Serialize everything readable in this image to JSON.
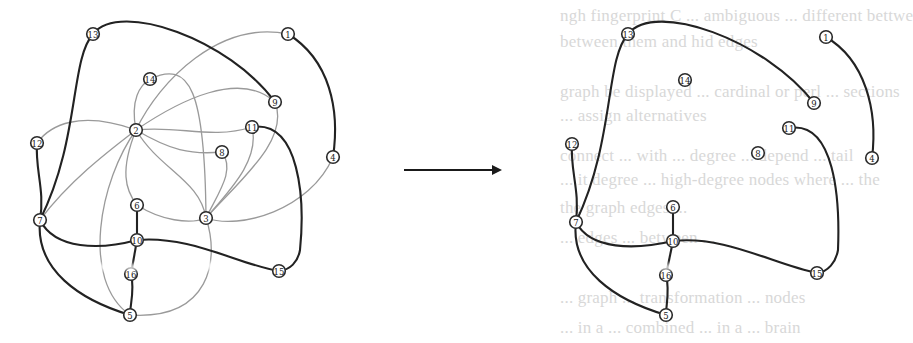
{
  "figure": {
    "arrow": {
      "from": [
        404,
        170
      ],
      "to": [
        500,
        170
      ]
    },
    "colors": {
      "thin_edge": "#9a9a9a",
      "thick_edge": "#222222",
      "node_stroke": "#2a2a2a",
      "background": "#ffffff"
    },
    "background_bleed_text": [
      {
        "text": "ngh fingerprint C ... ambiguous ... different  bettwe",
        "x": 560,
        "y": 18
      },
      {
        "text": "between them and hid edges",
        "x": 560,
        "y": 44
      },
      {
        "text": "graph be displayed ... cardinal or perl ... sections",
        "x": 560,
        "y": 94
      },
      {
        "text": "... assign alternatives",
        "x": 560,
        "y": 118
      },
      {
        "text": "connect ... with ... degree ... depend ... tail",
        "x": 560,
        "y": 158
      },
      {
        "text": "... it degree ... high-degree nodes where ... the",
        "x": 560,
        "y": 182
      },
      {
        "text": "the graph edges ...",
        "x": 560,
        "y": 210
      },
      {
        "text": "... edges ... between ...",
        "x": 560,
        "y": 240
      },
      {
        "text": "... graph ... transformation ... nodes",
        "x": 560,
        "y": 300
      },
      {
        "text": "... in a ... combined ... in a ... brain",
        "x": 560,
        "y": 330
      }
    ]
  },
  "left_graph": {
    "nodes": [
      {
        "id": "13",
        "x": 93,
        "y": 34
      },
      {
        "id": "1",
        "x": 288,
        "y": 34
      },
      {
        "id": "14",
        "x": 150,
        "y": 79
      },
      {
        "id": "9",
        "x": 275,
        "y": 102
      },
      {
        "id": "2",
        "x": 136,
        "y": 130
      },
      {
        "id": "11",
        "x": 252,
        "y": 127
      },
      {
        "id": "12",
        "x": 37,
        "y": 143
      },
      {
        "id": "8",
        "x": 222,
        "y": 152
      },
      {
        "id": "4",
        "x": 333,
        "y": 157
      },
      {
        "id": "6",
        "x": 137,
        "y": 205
      },
      {
        "id": "7",
        "x": 40,
        "y": 220
      },
      {
        "id": "3",
        "x": 206,
        "y": 218
      },
      {
        "id": "10",
        "x": 137,
        "y": 240
      },
      {
        "id": "16",
        "x": 131,
        "y": 274
      },
      {
        "id": "15",
        "x": 279,
        "y": 271
      },
      {
        "id": "5",
        "x": 130,
        "y": 315
      }
    ],
    "thin_edges": [
      {
        "d": "M136,130 C160,80 220,20 288,34"
      },
      {
        "d": "M136,130 C180,100 240,70 275,102"
      },
      {
        "d": "M136,130 C130,100 140,85 150,79"
      },
      {
        "d": "M150,79 C190,60 205,90 206,218"
      },
      {
        "d": "M136,130 C80,110 50,125 37,143"
      },
      {
        "d": "M136,130 C110,150 70,180 40,220"
      },
      {
        "d": "M136,130 C180,125 210,140 252,127"
      },
      {
        "d": "M136,130 C170,150 190,155 222,152"
      },
      {
        "d": "M136,130 C120,170 125,190 137,205"
      },
      {
        "d": "M136,130 C160,170 200,180 206,218"
      },
      {
        "d": "M136,130 C100,180 80,280 130,315"
      },
      {
        "d": "M222,152 C235,170 220,190 206,218"
      },
      {
        "d": "M252,127 C260,160 230,190 206,218"
      },
      {
        "d": "M275,102 C290,140 240,180 206,218"
      },
      {
        "d": "M333,157 C310,210 240,230 206,218"
      },
      {
        "d": "M137,205 C160,220 190,225 206,218"
      },
      {
        "d": "M206,218 C220,260 210,320 130,315"
      }
    ],
    "thick_edges": [
      {
        "d": "M93,34 C120,0 230,40 275,102"
      },
      {
        "d": "M93,34 C70,60 80,140 40,220"
      },
      {
        "d": "M288,34 C330,60 340,110 333,157"
      },
      {
        "d": "M37,143 C35,170 45,190 40,220"
      },
      {
        "d": "M40,220 C35,270 80,300 130,315"
      },
      {
        "d": "M40,220 C55,250 100,250 137,240"
      },
      {
        "d": "M137,205 L137,240"
      },
      {
        "d": "M137,240 L131,274"
      },
      {
        "d": "M131,274 C135,290 130,305 130,315"
      },
      {
        "d": "M137,240 C190,235 240,265 279,271"
      },
      {
        "d": "M252,127 C300,120 305,200 300,250 C298,262 290,270 279,271"
      }
    ]
  },
  "right_graph": {
    "nodes": [
      {
        "id": "13",
        "x": 628,
        "y": 34
      },
      {
        "id": "1",
        "x": 826,
        "y": 37
      },
      {
        "id": "14",
        "x": 685,
        "y": 80
      },
      {
        "id": "9",
        "x": 814,
        "y": 103
      },
      {
        "id": "11",
        "x": 789,
        "y": 128
      },
      {
        "id": "12",
        "x": 572,
        "y": 144
      },
      {
        "id": "8",
        "x": 758,
        "y": 153
      },
      {
        "id": "4",
        "x": 872,
        "y": 158
      },
      {
        "id": "6",
        "x": 673,
        "y": 207
      },
      {
        "id": "7",
        "x": 576,
        "y": 222
      },
      {
        "id": "10",
        "x": 673,
        "y": 241
      },
      {
        "id": "16",
        "x": 666,
        "y": 275
      },
      {
        "id": "15",
        "x": 817,
        "y": 273
      },
      {
        "id": "5",
        "x": 666,
        "y": 315
      }
    ],
    "thick_edges": [
      {
        "d": "M628,34 C655,0 765,40 814,103"
      },
      {
        "d": "M628,34 C605,60 615,140 576,222"
      },
      {
        "d": "M826,37 C865,60 878,110 872,158"
      },
      {
        "d": "M572,144 C570,170 580,190 576,222"
      },
      {
        "d": "M576,222 C570,270 615,300 666,315"
      },
      {
        "d": "M576,222 C590,250 635,250 673,241"
      },
      {
        "d": "M673,207 L673,241"
      },
      {
        "d": "M673,241 L666,275"
      },
      {
        "d": "M666,275 C670,290 666,305 666,315"
      },
      {
        "d": "M673,241 C725,235 775,265 817,273"
      },
      {
        "d": "M789,128 C835,120 840,200 838,250 C836,262 828,272 817,273"
      }
    ]
  }
}
